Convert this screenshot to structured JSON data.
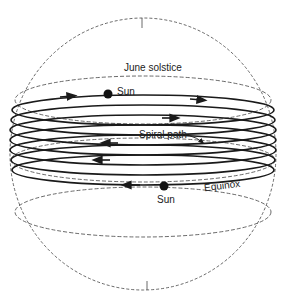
{
  "diagram": {
    "labels": {
      "june_solstice": "June solstice",
      "sun_top": "Sun",
      "spiral_path": "Spiral path",
      "equinox": "Equinox",
      "sun_bottom": "Sun"
    },
    "colors": {
      "line": "#1a1a1a",
      "dashed": "#444444",
      "background": "#ffffff"
    },
    "spiral_loop_count": 7
  }
}
